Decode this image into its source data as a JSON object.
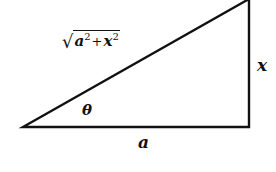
{
  "diagram": {
    "type": "right-triangle",
    "stroke_color": "#111111",
    "background": "#ffffff",
    "vertices": {
      "angle_vertex": [
        23,
        127
      ],
      "right_angle_vertex": [
        249,
        127
      ],
      "top_vertex": [
        249,
        0
      ]
    },
    "labels": {
      "hypotenuse": {
        "radical": "√",
        "base1": "a",
        "exp1": "2",
        "plus": "+",
        "base2": "x",
        "exp2": "2",
        "full_text": "√(a²+x²)"
      },
      "opposite_side": "x",
      "adjacent_side": "a",
      "angle": "θ"
    }
  }
}
